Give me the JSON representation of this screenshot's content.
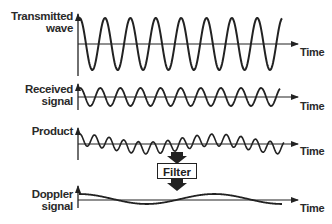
{
  "diagram": {
    "panels": [
      {
        "id": "transmitted",
        "label_line1": "Transmitted",
        "label_line2": "wave",
        "axis_label": "Time",
        "cycles": 8,
        "amplitude_px": 26
      },
      {
        "id": "received",
        "label_line1": "Received",
        "label_line2": "signal",
        "axis_label": "Time",
        "cycles": 10,
        "amplitude_px": 9
      },
      {
        "id": "product",
        "label_line1": "Product",
        "label_line2": "",
        "axis_label": "Time",
        "cycles": 14,
        "amplitude_px": 6
      },
      {
        "id": "doppler",
        "label_line1": "Doppler",
        "label_line2": "signal",
        "axis_label": "Time",
        "cycles": 1.5,
        "amplitude_px": 5
      }
    ],
    "filter": {
      "label": "Filter"
    },
    "colors": {
      "stroke": "#222222",
      "background": "#ffffff"
    }
  }
}
